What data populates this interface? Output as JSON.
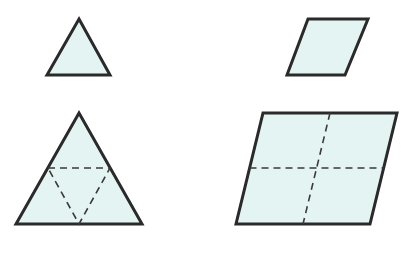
{
  "colors": {
    "fill": "#e3f4f2",
    "stroke": "#2a2a2a",
    "dash": "#3a3a3a",
    "background": "#ffffff"
  },
  "shapes": [
    {
      "id": "small-triangle",
      "type": "equilateral-triangle",
      "points": "79,19 110,75 47,75"
    },
    {
      "id": "small-parallelogram",
      "type": "parallelogram",
      "points": "308,19 368,19 345,75 287,75"
    },
    {
      "id": "large-triangle",
      "type": "equilateral-triangle",
      "points": "79,113 142,224 16,224",
      "fold_lines": "48,168 110,168 79,224 48,168"
    },
    {
      "id": "large-parallelogram",
      "type": "parallelogram",
      "points": "263,113 397,113 370,224 236,224",
      "fold_lines": [
        "249.5,168 383.5,168",
        "330,113 303,224"
      ]
    }
  ]
}
